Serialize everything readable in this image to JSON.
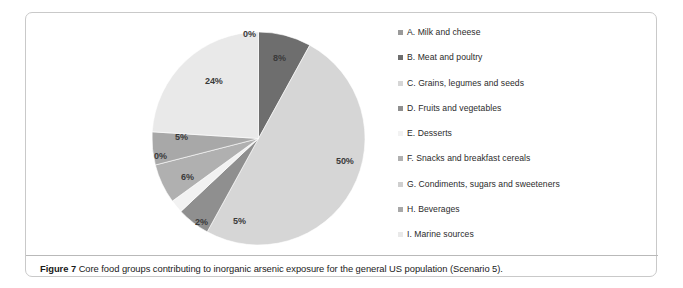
{
  "caption": {
    "label": "Figure 7",
    "text": "Core food groups contributing to inorganic arsenic exposure for the general US population (Scenario 5)."
  },
  "chart_data": {
    "type": "pie",
    "title": "Core food groups contributing to inorganic arsenic exposure for the general US population (Scenario 5)",
    "categories": [
      "A. Milk and cheese",
      "B. Meat and poultry",
      "C. Grains, legumes and seeds",
      "D. Fruits and vegetables",
      "E. Desserts",
      "F. Snacks and breakfast cereals",
      "G. Condiments, sugars and sweeteners",
      "H. Beverages",
      "I. Marine sources"
    ],
    "values": [
      0,
      8,
      50,
      5,
      2,
      6,
      0,
      5,
      24
    ],
    "data_labels": [
      "0%",
      "8%",
      "50%",
      "5%",
      "2%",
      "6%",
      "0%",
      "5%",
      "24%"
    ],
    "colors": [
      "#9a9a9a",
      "#6e6e6e",
      "#d6d6d6",
      "#8f8f8f",
      "#f2f2f2",
      "#b0b0b0",
      "#cfcfcf",
      "#a8a8a8",
      "#e9e9e9"
    ],
    "legend_position": "right",
    "grid": false,
    "units": "percent",
    "start_angle_deg": 0,
    "direction": "clockwise"
  },
  "legend": {
    "items": [
      {
        "label": "A. Milk and cheese",
        "color": "#9a9a9a"
      },
      {
        "label": "B. Meat and poultry",
        "color": "#6e6e6e"
      },
      {
        "label": "C. Grains, legumes and seeds",
        "color": "#d6d6d6"
      },
      {
        "label": "D. Fruits and vegetables",
        "color": "#8f8f8f"
      },
      {
        "label": "E. Desserts",
        "color": "#f2f2f2"
      },
      {
        "label": "F. Snacks and breakfast cereals",
        "color": "#b0b0b0"
      },
      {
        "label": "G. Condiments, sugars and sweeteners",
        "color": "#cfcfcf"
      },
      {
        "label": "H. Beverages",
        "color": "#a8a8a8"
      },
      {
        "label": "I. Marine sources",
        "color": "#e9e9e9"
      }
    ]
  },
  "slice_labels": [
    {
      "text": "0%",
      "x": 92,
      "y": -2
    },
    {
      "text": "8%",
      "x": 122,
      "y": 22
    },
    {
      "text": "50%",
      "x": 185,
      "y": 125
    },
    {
      "text": "5%",
      "x": 82,
      "y": 185
    },
    {
      "text": "2%",
      "x": 44,
      "y": 186
    },
    {
      "text": "6%",
      "x": 30,
      "y": 141
    },
    {
      "text": "0%",
      "x": 3,
      "y": 120
    },
    {
      "text": "5%",
      "x": 24,
      "y": 101
    },
    {
      "text": "24%",
      "x": 54,
      "y": 45
    }
  ]
}
